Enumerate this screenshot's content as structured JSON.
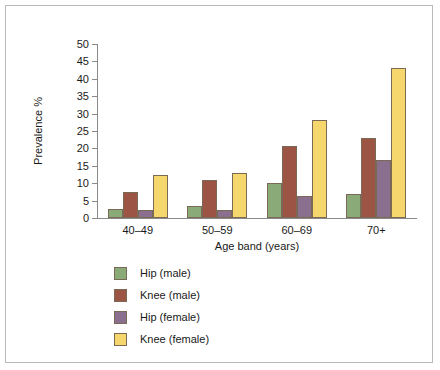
{
  "chart_data": {
    "type": "bar",
    "title": "",
    "xlabel": "Age band (years)",
    "ylabel": "Prevalence %",
    "categories": [
      "40–49",
      "50–59",
      "60–69",
      "70+"
    ],
    "series": [
      {
        "name": "Hip (male)",
        "color": "#8aab77",
        "values": [
          2.5,
          3.5,
          10.0,
          6.8
        ]
      },
      {
        "name": "Knee (male)",
        "color": "#9c5544",
        "values": [
          7.5,
          11.0,
          20.7,
          23.0
        ]
      },
      {
        "name": "Hip (female)",
        "color": "#8b6f8e",
        "values": [
          2.3,
          2.3,
          6.4,
          16.8
        ]
      },
      {
        "name": "Knee (female)",
        "color": "#f5d76e",
        "values": [
          12.5,
          13.0,
          28.3,
          43.0
        ]
      }
    ],
    "ylim": [
      0,
      50
    ],
    "ytick_labels": [
      "0",
      "5",
      "10",
      "15",
      "20",
      "25",
      "30",
      "35",
      "40",
      "45",
      "50"
    ],
    "ytick_values": [
      0,
      5,
      10,
      15,
      20,
      25,
      30,
      35,
      40,
      45,
      50
    ],
    "grid": false,
    "legend_position": "below-left",
    "legend_entries": [
      "Hip (male)",
      "Knee (male)",
      "Hip (female)",
      "Knee (female)"
    ],
    "bar_border_color": "#7a6a55",
    "axis_color": "#8a8a8a",
    "frame_color": "#b9b9b9",
    "background_color": "#ffffff"
  }
}
